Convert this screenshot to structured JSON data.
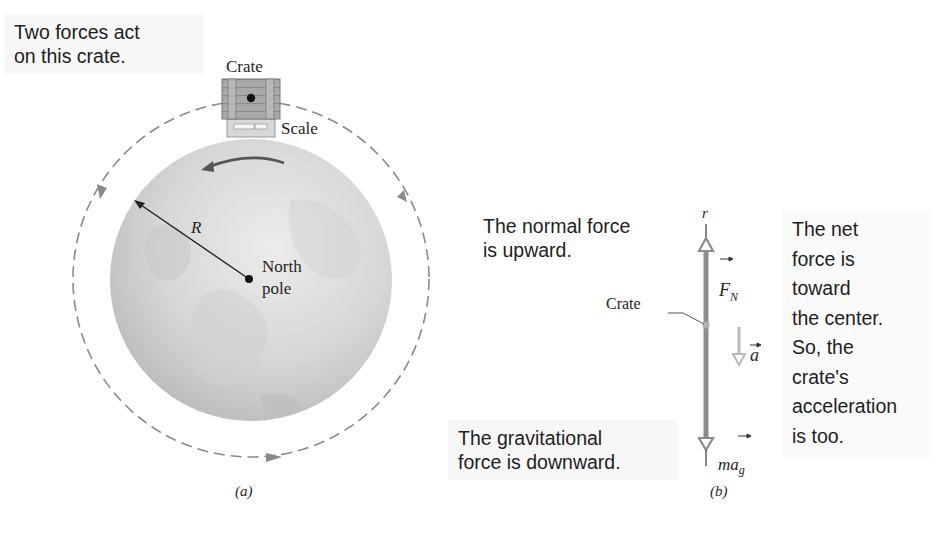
{
  "panel_a": {
    "callout": "Two forces act\non this crate.",
    "crate_label": "Crate",
    "scale_label": "Scale",
    "radius_label": "R",
    "pole_label": "North\npole",
    "caption": "(a)"
  },
  "panel_b": {
    "axis_label": "r",
    "normal_callout": "The normal force\nis upward.",
    "gravity_callout": "The gravitational\nforce is downward.",
    "net_callout": "The net\nforce is\ntoward\nthe center.\nSo, the\ncrate's\nacceleration\nis too.",
    "crate_label": "Crate",
    "normal_force_symbol": "F",
    "normal_force_subscript": "N",
    "acceleration_symbol": "a",
    "gravity_symbol_m": "m",
    "gravity_symbol_a": "a",
    "gravity_subscript": "g",
    "caption": "(b)"
  },
  "colors": {
    "globe_light": "#e6e6e6",
    "globe_dark": "#b4b4b4",
    "dashed_orbit": "#8a8a8a",
    "axis_bar": "#8c8c8c",
    "accel_arrow": "#b8b8b8",
    "text": "#1e1e1e"
  }
}
